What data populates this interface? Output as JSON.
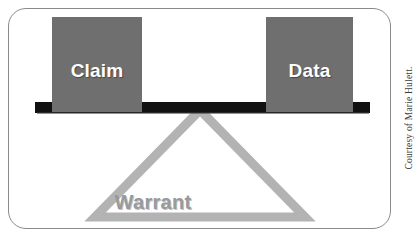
{
  "figure": {
    "kind": "balance-scale-diagram",
    "title_text": "",
    "frame": {
      "border_color": "#8a8a8a",
      "background_color": "#ffffff"
    },
    "blocks": [
      {
        "name": "claim",
        "label": "Claim",
        "fill_color": "#6f6f6f",
        "text_color": "#ffffff"
      },
      {
        "name": "data",
        "label": "Data",
        "fill_color": "#6f6f6f",
        "text_color": "#ffffff"
      }
    ],
    "beam": {
      "color": "#111111"
    },
    "fulcrum": {
      "label": "Warrant",
      "stroke_color": "#b3b3b3",
      "text_color": "#9a9a9a"
    }
  },
  "credit": {
    "text": "Courtesy of Marie Hulett."
  }
}
